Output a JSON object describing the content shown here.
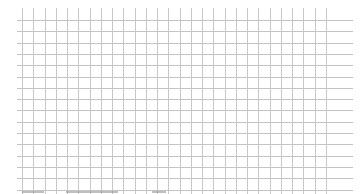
{
  "grid": {
    "background": "#ffffff",
    "line_color": "#c4c4c4",
    "vertical_lines": {
      "count": 28,
      "start_x": 22,
      "spacing": 11.25,
      "top": 8,
      "bottom": 194
    },
    "horizontal_lines": {
      "count": 16,
      "start_y": 20,
      "spacing": 11.3,
      "left": 17,
      "right": 353
    }
  },
  "bottom_marks": [
    {
      "left": 22,
      "width": 22
    },
    {
      "left": 66,
      "width": 52
    },
    {
      "left": 152,
      "width": 14
    }
  ]
}
